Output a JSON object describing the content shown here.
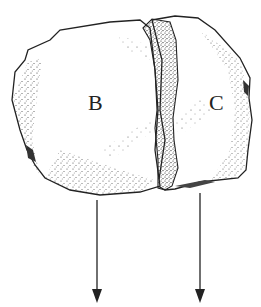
{
  "diagram": {
    "labels": {
      "left_block": "B",
      "right_block": "C"
    },
    "arrows": [
      {
        "id": "arrow-b",
        "direction": "down"
      },
      {
        "id": "arrow-c",
        "direction": "down"
      }
    ],
    "colors": {
      "stroke": "#222222",
      "stipple": "#333333",
      "background": "#ffffff"
    }
  }
}
